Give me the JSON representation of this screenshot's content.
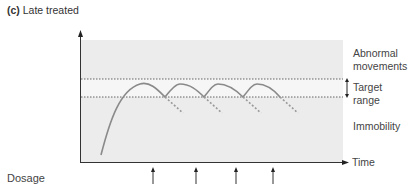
{
  "title": {
    "prefix": "(c)",
    "text": "Late treated"
  },
  "zones": {
    "upper_line1": "Abnormal",
    "upper_line2": "movements",
    "middle": "Target range",
    "lower": "Immobility"
  },
  "axes": {
    "x_label": "Time",
    "dosage_label": "Dosage"
  },
  "colors": {
    "plot_background": "#ececec",
    "target_band": "#f7f7f7",
    "curve": "#8a8a8a",
    "axis": "#333333"
  }
}
